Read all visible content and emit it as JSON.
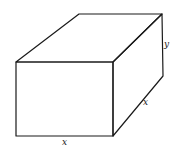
{
  "figure": {
    "type": "rectangular-box-diagram",
    "vertices": {
      "front_top_left": [
        16,
        62
      ],
      "front_top_right": [
        113,
        62
      ],
      "front_bottom_left": [
        16,
        136
      ],
      "front_bottom_right": [
        113,
        136
      ],
      "back_top_left": [
        79,
        14
      ],
      "back_top_right": [
        162,
        14
      ],
      "back_bottom_right": [
        163,
        76
      ]
    },
    "labels": {
      "height": {
        "text": "y",
        "x": 164,
        "y": 47
      },
      "depth": {
        "text": "x",
        "x": 143,
        "y": 105
      },
      "width": {
        "text": "x",
        "x": 62,
        "y": 145
      }
    },
    "colors": {
      "stroke": "#1a1a1a",
      "background": "#ffffff"
    }
  }
}
